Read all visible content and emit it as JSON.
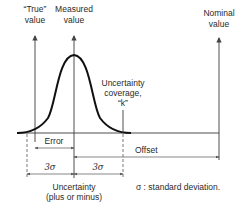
{
  "diagram": {
    "labels": {
      "true_value": [
        "“True”",
        "value"
      ],
      "measured_value": [
        "Measured",
        "value"
      ],
      "nominal_value": [
        "Nominal",
        "value"
      ],
      "uncertainty_coverage": [
        "Uncertainty",
        "coverage,",
        "“k”"
      ],
      "error": "Error",
      "offset": "Offset",
      "three_sigma_left": "3σ",
      "three_sigma_right": "3σ",
      "uncertainty": [
        "Uncertainty",
        "(plus or minus)"
      ],
      "legend": "σ : standard deviation."
    },
    "colors": {
      "curve": "#111111",
      "lines": "#3a3a3a",
      "text": "#2a2a2a"
    }
  }
}
